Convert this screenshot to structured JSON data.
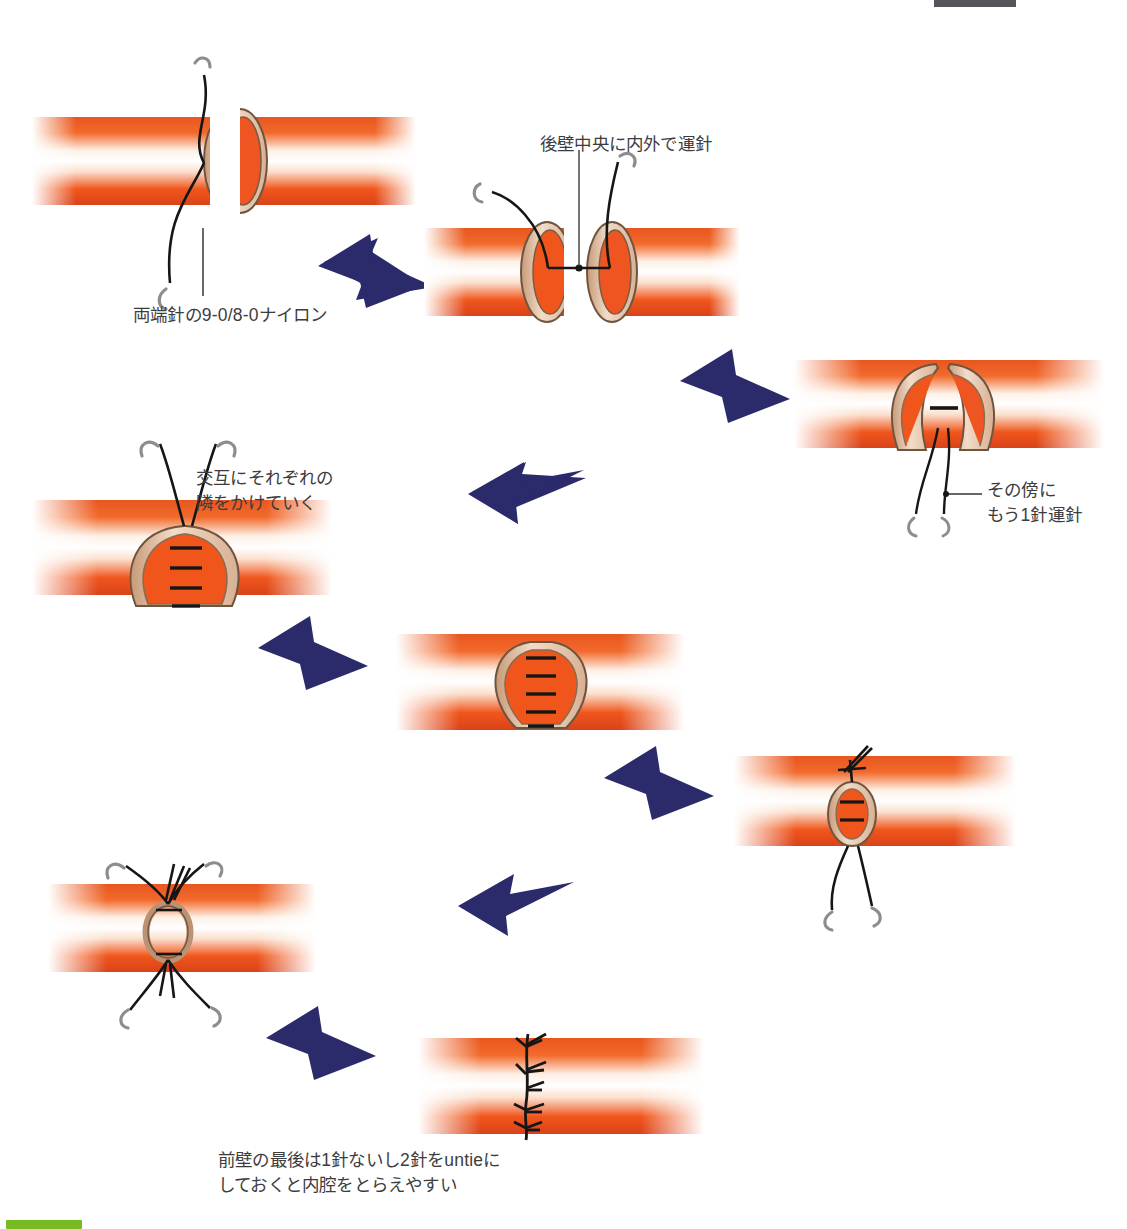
{
  "document": {
    "language": "ja",
    "kind": "surgical-illustration",
    "topic": "vascular end-to-end anastomosis suturing sequence"
  },
  "colors": {
    "tissue_orange": "#f0571f",
    "tissue_orange_deep": "#d8431a",
    "tissue_highlight": "#ffffff",
    "vessel_wall_tan": "#e6c4a8",
    "vessel_wall_edge": "#8a6b52",
    "suture_black": "#161616",
    "needle_gray": "#8d8d8d",
    "arrow_navy": "#2b2b6b",
    "text_gray": "#3d3d3d",
    "green_bar": "#76bc21",
    "top_bar": "#55555c"
  },
  "labels": {
    "step2_note": "後壁中央に内外で運針",
    "step1_note": "両端針の9-0/8-0ナイロン",
    "step3_note_line1": "その傍に",
    "step3_note_line2": "もう1針運針",
    "step4_note_line1": "交互にそれぞれの",
    "step4_note_line2": "隣をかけていく"
  },
  "caption": {
    "line1": "前壁の最後は1針ないし2針をuntieに",
    "line2": "しておくと内腔をとらえやすい"
  },
  "steps": [
    {
      "id": 1,
      "name": "cut-vessel-ends-with-double-armed-suture",
      "note": "両端針の9-0/8-0ナイロン"
    },
    {
      "id": 2,
      "name": "posterior-wall-center-stitch",
      "note": "後壁中央に内外で運針"
    },
    {
      "id": 3,
      "name": "adjacent-second-stitch",
      "note": "その傍にもう1針運針"
    },
    {
      "id": 4,
      "name": "alternating-adjacent-stitches",
      "note": "交互にそれぞれの隣をかけていく"
    },
    {
      "id": 5,
      "name": "posterior-wall-completed",
      "note": ""
    },
    {
      "id": 6,
      "name": "lumen-narrowing-anterior-wall",
      "note": ""
    },
    {
      "id": 7,
      "name": "final-untied-stitches",
      "note": ""
    },
    {
      "id": 8,
      "name": "anastomosis-complete",
      "note": "前壁の最後は1針ないし2針をuntieにしておくと内腔をとらえやすい"
    }
  ],
  "arrows": [
    {
      "id": 1,
      "from": 1,
      "to": 2,
      "direction": "down-right"
    },
    {
      "id": 2,
      "from": 2,
      "to": 3,
      "direction": "down-right"
    },
    {
      "id": 3,
      "from": 3,
      "to": 4,
      "direction": "left"
    },
    {
      "id": 4,
      "from": 4,
      "to": 5,
      "direction": "down-right"
    },
    {
      "id": 5,
      "from": 5,
      "to": 6,
      "direction": "down-right"
    },
    {
      "id": 6,
      "from": 6,
      "to": 7,
      "direction": "left"
    },
    {
      "id": 7,
      "from": 7,
      "to": 8,
      "direction": "down-right"
    }
  ]
}
